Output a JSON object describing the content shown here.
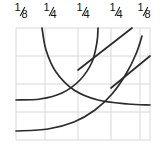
{
  "figure": {
    "title": "",
    "width": 164,
    "height": 147,
    "background_color": "#ffffff"
  },
  "labels": {
    "row_name": "column-width-fractions",
    "items": [
      {
        "text": "1/8",
        "numerator": "1",
        "denominator": "8",
        "x": 22
      },
      {
        "text": "1/4",
        "numerator": "1",
        "denominator": "4",
        "x": 51
      },
      {
        "text": "1/4",
        "numerator": "1",
        "denominator": "4",
        "x": 84
      },
      {
        "text": "1/4",
        "numerator": "1",
        "denominator": "4",
        "x": 117
      },
      {
        "text": "1/8",
        "numerator": "1",
        "denominator": "8",
        "x": 145
      }
    ]
  },
  "chart_data": {
    "type": "line",
    "title": "",
    "xlabel": "",
    "ylabel": "",
    "grid": true,
    "legend": "none",
    "colors": {
      "curve": "#2b2b2b",
      "grid": "#d8d8d8",
      "background": "#ffffff",
      "label_text": "#111111"
    },
    "plot_box": {
      "x0": 16,
      "y0": 28,
      "x1": 150,
      "y1": 140
    },
    "grid_lines": {
      "vertical_x": [
        16,
        45,
        78,
        111,
        140,
        150
      ],
      "horizontal_y": [
        28,
        56,
        84,
        112,
        140
      ]
    },
    "series": [
      {
        "name": "arc-outer-left",
        "kind": "arc",
        "points": [
          [
            42,
            28
          ],
          [
            46,
            50
          ],
          [
            56,
            72
          ],
          [
            74,
            90
          ],
          [
            98,
            100
          ],
          [
            128,
            104
          ],
          [
            150,
            105
          ]
        ]
      },
      {
        "name": "arc-inner-left",
        "kind": "arc",
        "points": [
          [
            16,
            100
          ],
          [
            40,
            99
          ],
          [
            62,
            93
          ],
          [
            80,
            80
          ],
          [
            92,
            62
          ],
          [
            97,
            42
          ],
          [
            98,
            28
          ]
        ]
      },
      {
        "name": "arc-outer-lower",
        "kind": "arc",
        "points": [
          [
            16,
            131
          ],
          [
            48,
            129
          ],
          [
            74,
            122
          ],
          [
            95,
            110
          ],
          [
            112,
            94
          ],
          [
            126,
            74
          ],
          [
            136,
            54
          ],
          [
            142,
            36
          ]
        ]
      },
      {
        "name": "ray-upper",
        "kind": "line",
        "points": [
          [
            78,
            70
          ],
          [
            132,
            28
          ]
        ]
      },
      {
        "name": "ray-lower",
        "kind": "line",
        "points": [
          [
            111,
            88
          ],
          [
            150,
            56
          ]
        ]
      }
    ],
    "xlim": [
      16,
      150
    ],
    "ylim": [
      28,
      140
    ]
  }
}
